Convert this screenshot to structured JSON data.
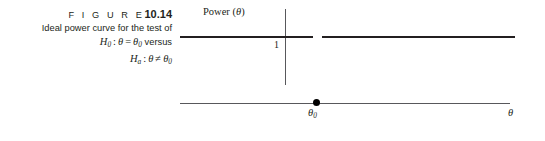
{
  "figure": {
    "label_word": "F I G U R E",
    "number": "10.14",
    "description": "Ideal power curve for the test of",
    "null_hypothesis": {
      "symbol": "H",
      "subscript": "0",
      "colon": ":",
      "parameter": "θ",
      "relation": "=",
      "value": "θ",
      "value_subscript": "0",
      "connector": "versus"
    },
    "alternative_hypothesis": {
      "symbol": "H",
      "subscript": "a",
      "colon": ":",
      "parameter": "θ",
      "relation": "≠",
      "value": "θ",
      "value_subscript": "0"
    }
  },
  "chart_data": {
    "type": "line",
    "title": "",
    "ylabel": "Power (θ)",
    "xlabel": "θ",
    "ylabel_text": "Power (",
    "ylabel_symbol": "θ",
    "ylabel_close": ")",
    "y_tick_labels": [
      "1"
    ],
    "x_tick_labels": [
      "θ"
    ],
    "x_tick_subscripts": [
      "0"
    ],
    "ylim": [
      0,
      1.15
    ],
    "grid": false,
    "legend": null,
    "series": [
      {
        "name": "Ideal power curve",
        "x": [
          -1.0,
          0.0
        ],
        "values": [
          1,
          1
        ],
        "note": "power equals 1 for all theta less than theta-0"
      },
      {
        "name": "Ideal power curve",
        "x": [
          0.0,
          1.0
        ],
        "values": [
          1,
          1
        ],
        "note": "power equals 1 for all theta greater than theta-0"
      }
    ],
    "points": [
      {
        "name": "theta-0 point",
        "x_label": "θ",
        "x_subscript": "0",
        "y": 0,
        "marker": "filled-circle"
      }
    ],
    "annotations": [
      {
        "name": "power-level-one",
        "text": "1",
        "y": 1
      },
      {
        "name": "curve-gap",
        "text": "open at theta-0",
        "x": 0,
        "y": 1
      }
    ]
  }
}
